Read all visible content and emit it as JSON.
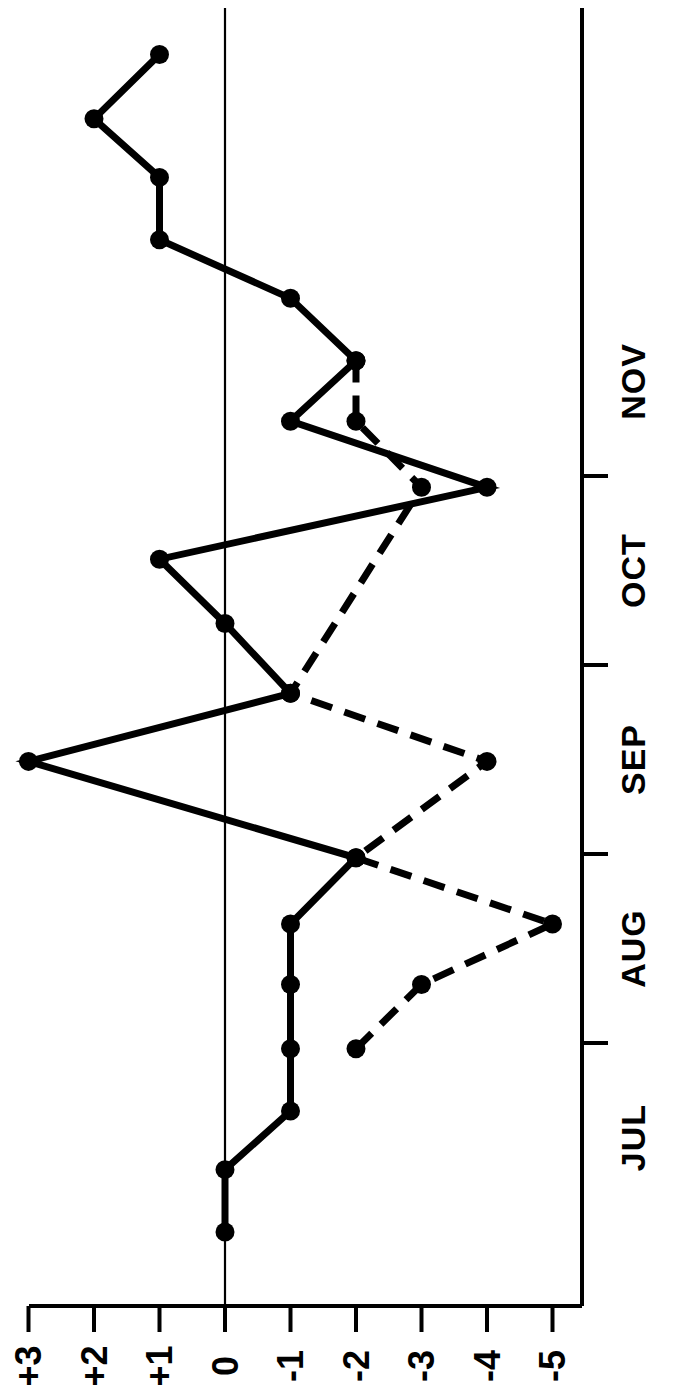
{
  "chart_data": {
    "type": "line",
    "title": "",
    "subtitle": "",
    "orientation": "rotated-90-clockwise",
    "xlabel": "",
    "ylabel": "",
    "value_axis": {
      "name": "value-axis",
      "tick_labels": [
        "+3",
        "+2",
        "+1",
        "0",
        "-1",
        "-2",
        "-3",
        "-4",
        "-5"
      ],
      "tick_values": [
        3,
        2,
        1,
        0,
        -1,
        -2,
        -3,
        -4,
        -5
      ],
      "range": [
        3,
        -5
      ],
      "zero_line": true
    },
    "time_axis": {
      "name": "time-axis",
      "tick_labels": [
        "JUL",
        "AUG",
        "SEP",
        "OCT",
        "NOV"
      ],
      "tick_positions_months": [
        0,
        1,
        2,
        3,
        4
      ],
      "grid": false
    },
    "legend": {
      "show": false,
      "entries": []
    },
    "series": [
      {
        "name": "solid-series",
        "style": "solid",
        "marker": "filled-circle",
        "color": "#000000",
        "points": [
          {
            "t": 0.0,
            "v": 0
          },
          {
            "t": 0.33,
            "v": 0
          },
          {
            "t": 0.64,
            "v": -1
          },
          {
            "t": 0.97,
            "v": -1
          },
          {
            "t": 1.31,
            "v": -1
          },
          {
            "t": 1.63,
            "v": -1
          },
          {
            "t": 1.98,
            "v": -2
          },
          {
            "t": 2.49,
            "v": 3
          },
          {
            "t": 2.85,
            "v": -1
          },
          {
            "t": 3.22,
            "v": 0
          },
          {
            "t": 3.56,
            "v": 1
          },
          {
            "t": 3.94,
            "v": -4
          },
          {
            "t": 4.29,
            "v": -1
          },
          {
            "t": 4.61,
            "v": -2
          },
          {
            "t": 4.94,
            "v": -1
          },
          {
            "t": 5.25,
            "v": 1
          },
          {
            "t": 5.58,
            "v": 1
          },
          {
            "t": 5.89,
            "v": 2
          },
          {
            "t": 6.23,
            "v": 1
          }
        ]
      },
      {
        "name": "dashed-series",
        "style": "dashed",
        "marker": "filled-circle",
        "color": "#000000",
        "points": [
          {
            "t": 0.97,
            "v": -2
          },
          {
            "t": 1.31,
            "v": -3
          },
          {
            "t": 1.63,
            "v": -5
          },
          {
            "t": 1.98,
            "v": -2
          },
          {
            "t": 2.49,
            "v": -4
          },
          {
            "t": 2.85,
            "v": -1
          },
          {
            "t": 3.94,
            "v": -3
          },
          {
            "t": 4.29,
            "v": -2
          },
          {
            "t": 4.61,
            "v": -2
          }
        ]
      }
    ]
  },
  "axis": {
    "months": [
      {
        "label": "JUL"
      },
      {
        "label": "AUG"
      },
      {
        "label": "SEP"
      },
      {
        "label": "OCT"
      },
      {
        "label": "NOV"
      }
    ],
    "values": [
      {
        "label": "+3"
      },
      {
        "label": "+2"
      },
      {
        "label": "+1"
      },
      {
        "label": "0"
      },
      {
        "label": "-1"
      },
      {
        "label": "-2"
      },
      {
        "label": "-3"
      },
      {
        "label": "-4"
      },
      {
        "label": "-5"
      }
    ]
  },
  "colors": {
    "ink": "#000000",
    "background": "#ffffff"
  }
}
